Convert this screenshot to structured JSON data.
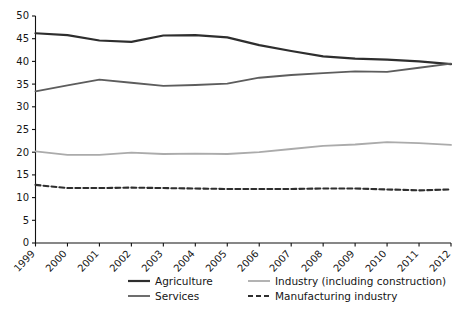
{
  "chart_data": {
    "type": "line",
    "title": "",
    "subtitle": "",
    "xlabel": "",
    "ylabel": "",
    "x": [
      "1999",
      "2000",
      "2001",
      "2002",
      "2003",
      "2004",
      "2005",
      "2006",
      "2007",
      "2008",
      "2009",
      "2010",
      "2011",
      "2012"
    ],
    "xtick_labels": [
      "1999",
      "2000",
      "2001",
      "2002",
      "2003",
      "2004",
      "2005",
      "2006",
      "2007",
      "2008",
      "2009",
      "2010",
      "2011",
      "2012"
    ],
    "ytick_labels": [
      "0",
      "5",
      "10",
      "15",
      "20",
      "25",
      "30",
      "35",
      "40",
      "45",
      "50"
    ],
    "ytick_values": [
      0,
      5,
      10,
      15,
      20,
      25,
      30,
      35,
      40,
      45,
      50
    ],
    "ylim": [
      0,
      50
    ],
    "grid": false,
    "legend_position": "bottom",
    "series": [
      {
        "name": "Agriculture",
        "color": "#2e2e2e",
        "width": 2.2,
        "dash": "none",
        "values": [
          46.2,
          45.8,
          44.6,
          44.3,
          45.7,
          45.8,
          45.3,
          43.6,
          42.3,
          41.1,
          40.6,
          40.4,
          40.0,
          39.4
        ]
      },
      {
        "name": "Services",
        "color": "#5d5d5d",
        "width": 1.8,
        "dash": "none",
        "values": [
          33.4,
          34.7,
          36.0,
          35.3,
          34.6,
          34.8,
          35.1,
          36.4,
          37.0,
          37.4,
          37.8,
          37.7,
          38.6,
          39.5
        ]
      },
      {
        "name": "Industry (including construction)",
        "color": "#ababab",
        "width": 1.8,
        "dash": "none",
        "values": [
          20.2,
          19.4,
          19.4,
          19.9,
          19.6,
          19.7,
          19.6,
          20.0,
          20.7,
          21.4,
          21.7,
          22.2,
          22.0,
          21.6
        ]
      },
      {
        "name": "Manufacturing industry",
        "color": "#2e2e2e",
        "width": 2.1,
        "dash": "5,3",
        "values": [
          12.8,
          12.1,
          12.1,
          12.2,
          12.1,
          12.0,
          11.9,
          11.9,
          11.9,
          12.0,
          12.0,
          11.8,
          11.6,
          11.8
        ]
      }
    ]
  },
  "legend": {
    "items": [
      {
        "label": "Agriculture",
        "color": "#2e2e2e",
        "dash": "none",
        "width": 2.2
      },
      {
        "label": "Industry (including construction)",
        "color": "#ababab",
        "dash": "none",
        "width": 1.8
      },
      {
        "label": "Services",
        "color": "#5d5d5d",
        "dash": "none",
        "width": 1.8
      },
      {
        "label": "Manufacturing industry",
        "color": "#2e2e2e",
        "dash": "5,3",
        "width": 2.1
      }
    ]
  },
  "axes": {
    "y_min_label": "0",
    "y_max_label": "50",
    "x_first_label": "1999",
    "x_last_label": "2012"
  }
}
